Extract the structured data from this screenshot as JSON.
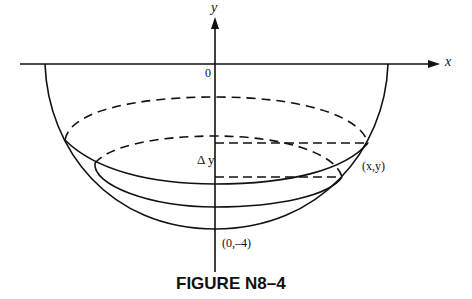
{
  "figure": {
    "caption": "FIGURE N8–4",
    "axis_x_label": "x",
    "axis_y_label": "y",
    "origin_label": "0",
    "delta_label": "Δ y",
    "point_label": "(x,y)",
    "bottom_label": "(0,–4)"
  },
  "colors": {
    "stroke": "#111111",
    "background": "#ffffff"
  }
}
